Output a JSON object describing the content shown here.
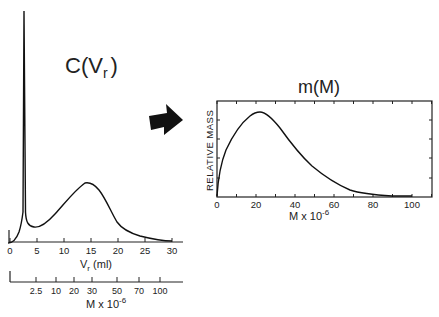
{
  "chart_data": [
    {
      "type": "line",
      "title": "C(V_r)",
      "title_main": "C(V",
      "title_sub": "r",
      "title_close": ")",
      "xlabel": "V_r (ml)",
      "xlabel_main": "V",
      "xlabel_sub": "r",
      "xlabel_unit": " (ml)",
      "ylabel": "",
      "xlim": [
        0,
        32
      ],
      "xticks": [
        0,
        5,
        10,
        15,
        20,
        25,
        30
      ],
      "x": [
        0,
        1,
        2,
        2.5,
        2.8,
        3.0,
        3.3,
        4,
        5,
        6,
        8,
        10,
        12,
        14,
        15,
        16,
        18,
        20,
        22,
        24,
        26,
        28,
        29.5
      ],
      "values": [
        0,
        2,
        20,
        60,
        100,
        40,
        18,
        15,
        14,
        15,
        22,
        35,
        52,
        60,
        59,
        52,
        35,
        18,
        10,
        6,
        3,
        1,
        0.5
      ],
      "annotations": [
        "Sharp void-volume peak near V_r ≈ 2.8 ml",
        "Broad peak near V_r ≈ 14 ml"
      ],
      "secondary_axis": {
        "label": "M x 10^-6",
        "label_main": "M x 10",
        "label_sup": "-6",
        "ticks": [
          "2.5",
          "10",
          "20",
          "30",
          "50",
          "70",
          "100"
        ]
      },
      "grid": false
    },
    {
      "type": "line",
      "title": "m(M)",
      "xlabel": "M x 10^-6",
      "xlabel_main": "M x 10",
      "xlabel_sup": "-6",
      "ylabel": "RELATIVE MASS",
      "xlim": [
        0,
        110
      ],
      "xticks": [
        0,
        20,
        40,
        60,
        80,
        100
      ],
      "x": [
        0,
        2,
        5,
        10,
        15,
        20,
        22,
        25,
        30,
        35,
        40,
        45,
        50,
        55,
        60,
        65,
        70,
        75,
        80,
        90,
        100
      ],
      "values": [
        0,
        30,
        55,
        78,
        92,
        98,
        98.5,
        96,
        85,
        69,
        53,
        39,
        27,
        18,
        11,
        6,
        3,
        1.5,
        0.8,
        0.3,
        0
      ],
      "grid": false
    }
  ],
  "arrow": {
    "direction": "right",
    "color": "#111111"
  }
}
